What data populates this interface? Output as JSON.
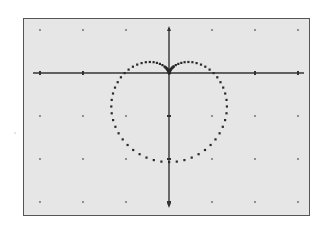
{
  "calculator_graph": {
    "function": "r = 1 - sin(θ)",
    "curve_name": "cardioid",
    "mode": "polar",
    "window": {
      "xmin": -3,
      "xmax": 3,
      "xscl": 1,
      "ymin": -3,
      "ymax": 1,
      "yscl": 1
    },
    "origin_px": [
      169,
      73
    ],
    "unit_px": 43,
    "curve_unit_px": 44.5,
    "colors": {
      "screen_bg": "#e6e6e6",
      "axis": "#333333",
      "curve": "#2a2a2a",
      "grid_dot": "#666666",
      "frame": "#555555"
    },
    "x_ticks": [
      -3,
      -2,
      2,
      3
    ],
    "y_ticks": [
      -1,
      -2,
      -3
    ],
    "grid": true,
    "plot_points": 72
  }
}
